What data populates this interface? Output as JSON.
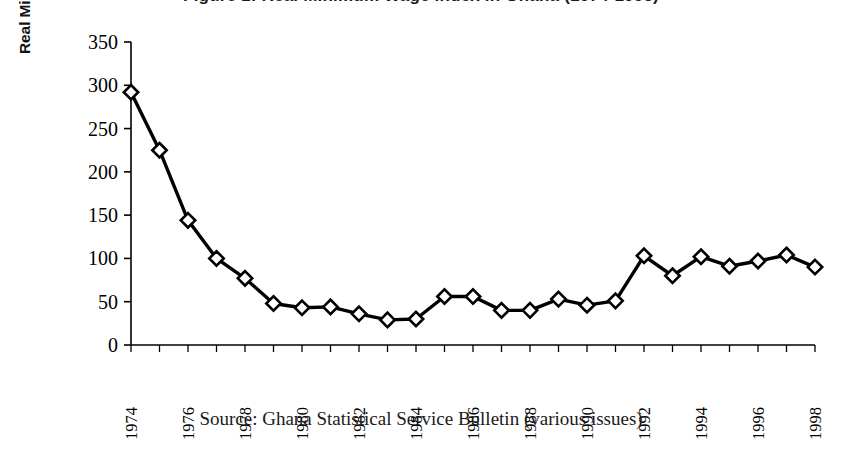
{
  "figure": {
    "title": "Figure 1: Real Minimum Wage Index in Ghana (1974-1998)",
    "source_caption": "Source: Ghana Statistical Service Bulletin (various issues)"
  },
  "chart_data": {
    "type": "line",
    "title": "Figure 1: Real Minimum Wage Index in Ghana (1974-1998)",
    "xlabel": "",
    "ylabel": "Real Min. Wage Index (1977=100)",
    "ylim": [
      0,
      350
    ],
    "yticks": [
      0,
      50,
      100,
      150,
      200,
      250,
      300,
      350
    ],
    "ytick_labels": [
      "0",
      "50",
      "100",
      "150",
      "200",
      "250",
      "300",
      "350"
    ],
    "xlim": [
      1974,
      1998
    ],
    "xticks": [
      1974,
      1975,
      1976,
      1977,
      1978,
      1979,
      1980,
      1981,
      1982,
      1983,
      1984,
      1985,
      1986,
      1987,
      1988,
      1989,
      1990,
      1991,
      1992,
      1993,
      1994,
      1995,
      1996,
      1997,
      1998
    ],
    "xtick_labels": [
      "1974",
      "",
      "1976",
      "",
      "1978",
      "",
      "1980",
      "",
      "1982",
      "",
      "1984",
      "",
      "1986",
      "",
      "1988",
      "",
      "1990",
      "",
      "1992",
      "",
      "1994",
      "",
      "1996",
      "",
      "1998"
    ],
    "xtick_labels_rotation": 90,
    "grid": false,
    "legend": false,
    "marker": "diamond",
    "marker_fill": "#ffffff",
    "line_color": "#000000",
    "x": [
      1974,
      1975,
      1976,
      1977,
      1978,
      1979,
      1980,
      1981,
      1982,
      1983,
      1984,
      1985,
      1986,
      1987,
      1988,
      1989,
      1990,
      1991,
      1992,
      1993,
      1994,
      1995,
      1996,
      1997,
      1998
    ],
    "values": [
      292,
      225,
      144,
      100,
      77,
      48,
      43,
      44,
      36,
      29,
      30,
      56,
      56,
      40,
      40,
      53,
      46,
      51,
      103,
      80,
      102,
      91,
      97,
      104,
      90
    ],
    "categories": [
      "1974",
      "1975",
      "1976",
      "1977",
      "1978",
      "1979",
      "1980",
      "1981",
      "1982",
      "1983",
      "1984",
      "1985",
      "1986",
      "1987",
      "1988",
      "1989",
      "1990",
      "1991",
      "1992",
      "1993",
      "1994",
      "1995",
      "1996",
      "1997",
      "1998"
    ]
  }
}
